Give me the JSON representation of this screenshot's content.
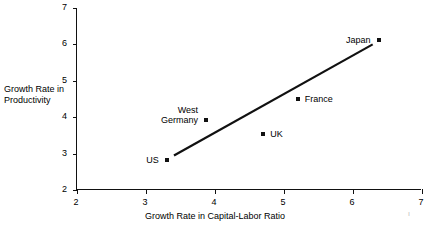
{
  "chart_data": {
    "type": "scatter",
    "title": "",
    "xlabel": "Growth Rate in Capital-Labor Ratio",
    "ylabel": "Growth Rate in\nProductivity",
    "ylabel_lines": [
      "Growth Rate in",
      "Productivity"
    ],
    "xlim": [
      2,
      7
    ],
    "ylim": [
      2,
      7
    ],
    "xticks": [
      "2",
      "3",
      "4",
      "5",
      "6",
      "7"
    ],
    "yticks": [
      "2",
      "3",
      "4",
      "5",
      "6",
      "7"
    ],
    "xtick_values": [
      2,
      3,
      4,
      5,
      6,
      7
    ],
    "ytick_values": [
      2,
      3,
      4,
      5,
      6,
      7
    ],
    "grid": false,
    "legend": "none",
    "marker_color": "#111111",
    "line_color": "#111111",
    "points": [
      {
        "label": "US",
        "x": 3.3,
        "y": 2.82,
        "label_side": "left",
        "label_lines": [
          "US"
        ]
      },
      {
        "label": "West Germany",
        "x": 3.87,
        "y": 3.92,
        "label_side": "left",
        "label_lines": [
          "West",
          "Germany"
        ]
      },
      {
        "label": "UK",
        "x": 4.7,
        "y": 3.53,
        "label_side": "right",
        "label_lines": [
          "UK"
        ]
      },
      {
        "label": "France",
        "x": 5.2,
        "y": 4.5,
        "label_side": "right",
        "label_lines": [
          "France"
        ]
      },
      {
        "label": "Japan",
        "x": 6.37,
        "y": 6.13,
        "label_side": "left",
        "label_lines": [
          "Japan"
        ]
      }
    ],
    "trendline": {
      "x0": 3.42,
      "y0": 2.95,
      "x1": 6.3,
      "y1": 6.0
    },
    "annotations": []
  },
  "figure": {
    "background_color": "#ffffff",
    "axis_color": "#111111",
    "stray_mark": "ı"
  }
}
